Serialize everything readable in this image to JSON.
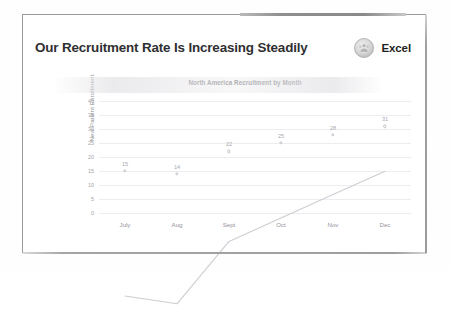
{
  "slide": {
    "title": "Our Recruitment Rate Is Increasing Steadily",
    "brand": {
      "name": "Excel",
      "badge_icon": "people-emblem-icon",
      "badge_color": "#c6c6c6"
    },
    "frame_color": "#9a9a9a",
    "background": "#ffffff",
    "title_color": "#2f2f31"
  },
  "chart_data": {
    "type": "line",
    "title": "North America Recruitment by Month",
    "xlabel": "",
    "ylabel": "New Patient Enrollment",
    "categories": [
      "July",
      "Aug",
      "Sept",
      "Oct",
      "Nov",
      "Dec"
    ],
    "values": [
      15,
      14,
      22,
      25,
      28,
      31
    ],
    "data_labels": [
      "15",
      "14",
      "22",
      "25",
      "28",
      "31"
    ],
    "ylim": [
      0,
      40
    ],
    "ytick_step": 5,
    "yticks": [
      "40",
      "35",
      "30",
      "25",
      "20",
      "15",
      "10",
      "5",
      "0"
    ],
    "grid": true,
    "legend": "none",
    "series_color": "#cdcdd3",
    "marker_style": "circle-open",
    "label_color": "#a9a9b0",
    "axis_text_color": "#93939a"
  }
}
